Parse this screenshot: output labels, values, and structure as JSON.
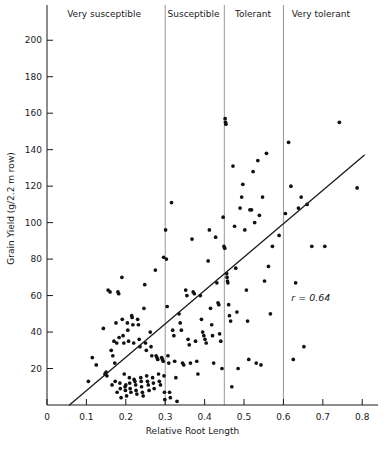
{
  "chart_data": {
    "type": "scatter",
    "title": "",
    "xlabel": "Relative Root Length",
    "ylabel": "Grain Yield (g/2.2 m row)",
    "xlim": [
      0,
      0.84
    ],
    "ylim": [
      0,
      210
    ],
    "xticks": [
      "0",
      "0.1",
      "0.2",
      "0.3",
      "0.4",
      "0.5",
      "0.6",
      "0.7",
      "0.8"
    ],
    "xtickvalues": [
      0,
      0.1,
      0.2,
      0.3,
      0.4,
      0.5,
      0.6,
      0.7,
      0.8
    ],
    "yticks": [
      "20",
      "40",
      "60",
      "80",
      "100",
      "120",
      "140",
      "160",
      "180",
      "200"
    ],
    "ytickvalues": [
      20,
      40,
      60,
      80,
      100,
      120,
      140,
      160,
      180,
      200
    ],
    "grid": false,
    "legend": "none",
    "annotation": "r = 0.64",
    "annotation_symbol": "r",
    "annotation_value": "= 0.64",
    "annotation_x": 0.62,
    "annotation_y": 57,
    "fit_line": {
      "x": [
        0.057,
        0.805
      ],
      "y": [
        0,
        137
      ]
    },
    "zones": [
      {
        "label": "Very susceptible",
        "x_start": 0.0,
        "x_end": 0.3,
        "label_x": 0.145
      },
      {
        "label": "Susceptible",
        "x_start": 0.3,
        "x_end": 0.45,
        "label_x": 0.372
      },
      {
        "label": "Tolerant",
        "x_start": 0.45,
        "x_end": 0.6,
        "label_x": 0.523
      },
      {
        "label": "Very tolerant",
        "x_start": 0.6,
        "x_end": 0.84,
        "label_x": 0.695
      }
    ],
    "zone_dividers": [
      0.3,
      0.45,
      0.6
    ],
    "points": [
      [
        0.105,
        13
      ],
      [
        0.115,
        26
      ],
      [
        0.125,
        22
      ],
      [
        0.143,
        42
      ],
      [
        0.147,
        17
      ],
      [
        0.15,
        18
      ],
      [
        0.152,
        16
      ],
      [
        0.155,
        63
      ],
      [
        0.16,
        62
      ],
      [
        0.163,
        30
      ],
      [
        0.165,
        11
      ],
      [
        0.167,
        27
      ],
      [
        0.17,
        35
      ],
      [
        0.172,
        23
      ],
      [
        0.173,
        13
      ],
      [
        0.175,
        45
      ],
      [
        0.177,
        34
      ],
      [
        0.178,
        7
      ],
      [
        0.18,
        62
      ],
      [
        0.182,
        61
      ],
      [
        0.183,
        37
      ],
      [
        0.185,
        12
      ],
      [
        0.186,
        9
      ],
      [
        0.188,
        4
      ],
      [
        0.19,
        70
      ],
      [
        0.191,
        47
      ],
      [
        0.193,
        38
      ],
      [
        0.195,
        34
      ],
      [
        0.196,
        17
      ],
      [
        0.198,
        10
      ],
      [
        0.199,
        8
      ],
      [
        0.2,
        11
      ],
      [
        0.202,
        5
      ],
      [
        0.204,
        45
      ],
      [
        0.205,
        41
      ],
      [
        0.207,
        35
      ],
      [
        0.209,
        15
      ],
      [
        0.21,
        12
      ],
      [
        0.211,
        9
      ],
      [
        0.213,
        7
      ],
      [
        0.215,
        49
      ],
      [
        0.216,
        48
      ],
      [
        0.218,
        44
      ],
      [
        0.22,
        34
      ],
      [
        0.221,
        14
      ],
      [
        0.223,
        13
      ],
      [
        0.225,
        11
      ],
      [
        0.226,
        8
      ],
      [
        0.228,
        6
      ],
      [
        0.23,
        47
      ],
      [
        0.232,
        44
      ],
      [
        0.234,
        36
      ],
      [
        0.236,
        32
      ],
      [
        0.238,
        15
      ],
      [
        0.239,
        13
      ],
      [
        0.24,
        10
      ],
      [
        0.242,
        7
      ],
      [
        0.244,
        5
      ],
      [
        0.246,
        53
      ],
      [
        0.248,
        66
      ],
      [
        0.25,
        34
      ],
      [
        0.252,
        30
      ],
      [
        0.253,
        16
      ],
      [
        0.255,
        13
      ],
      [
        0.257,
        11
      ],
      [
        0.259,
        8
      ],
      [
        0.262,
        40
      ],
      [
        0.264,
        32
      ],
      [
        0.266,
        27
      ],
      [
        0.268,
        15
      ],
      [
        0.27,
        12
      ],
      [
        0.272,
        9
      ],
      [
        0.275,
        74
      ],
      [
        0.277,
        27
      ],
      [
        0.279,
        26
      ],
      [
        0.281,
        25
      ],
      [
        0.283,
        17
      ],
      [
        0.285,
        13
      ],
      [
        0.288,
        11
      ],
      [
        0.291,
        26
      ],
      [
        0.293,
        25
      ],
      [
        0.295,
        24
      ],
      [
        0.296,
        81
      ],
      [
        0.297,
        16
      ],
      [
        0.298,
        7
      ],
      [
        0.299,
        3
      ],
      [
        0.301,
        96
      ],
      [
        0.303,
        80
      ],
      [
        0.305,
        54
      ],
      [
        0.307,
        27
      ],
      [
        0.309,
        23
      ],
      [
        0.311,
        7
      ],
      [
        0.313,
        4
      ],
      [
        0.316,
        111
      ],
      [
        0.319,
        41
      ],
      [
        0.322,
        38
      ],
      [
        0.324,
        24
      ],
      [
        0.327,
        15
      ],
      [
        0.33,
        2
      ],
      [
        0.335,
        50
      ],
      [
        0.338,
        45
      ],
      [
        0.341,
        41
      ],
      [
        0.344,
        23
      ],
      [
        0.347,
        22
      ],
      [
        0.352,
        63
      ],
      [
        0.355,
        60
      ],
      [
        0.358,
        36
      ],
      [
        0.361,
        33
      ],
      [
        0.364,
        23
      ],
      [
        0.368,
        91
      ],
      [
        0.371,
        62
      ],
      [
        0.374,
        61
      ],
      [
        0.377,
        35
      ],
      [
        0.38,
        24
      ],
      [
        0.383,
        17
      ],
      [
        0.389,
        60
      ],
      [
        0.392,
        47
      ],
      [
        0.395,
        40
      ],
      [
        0.398,
        38
      ],
      [
        0.401,
        36
      ],
      [
        0.404,
        34
      ],
      [
        0.409,
        79
      ],
      [
        0.412,
        96
      ],
      [
        0.415,
        53
      ],
      [
        0.418,
        44
      ],
      [
        0.42,
        38
      ],
      [
        0.423,
        23
      ],
      [
        0.428,
        92
      ],
      [
        0.431,
        67
      ],
      [
        0.434,
        56
      ],
      [
        0.436,
        55
      ],
      [
        0.438,
        39
      ],
      [
        0.441,
        35
      ],
      [
        0.444,
        20
      ],
      [
        0.447,
        103
      ],
      [
        0.449,
        87
      ],
      [
        0.451,
        86
      ],
      [
        0.452,
        157
      ],
      [
        0.453,
        155
      ],
      [
        0.454,
        154
      ],
      [
        0.456,
        72
      ],
      [
        0.457,
        70
      ],
      [
        0.458,
        68
      ],
      [
        0.459,
        67
      ],
      [
        0.461,
        55
      ],
      [
        0.463,
        49
      ],
      [
        0.466,
        46
      ],
      [
        0.469,
        10
      ],
      [
        0.472,
        131
      ],
      [
        0.476,
        98
      ],
      [
        0.479,
        75
      ],
      [
        0.482,
        51
      ],
      [
        0.485,
        20
      ],
      [
        0.49,
        108
      ],
      [
        0.494,
        114
      ],
      [
        0.497,
        121
      ],
      [
        0.502,
        96
      ],
      [
        0.506,
        63
      ],
      [
        0.509,
        46
      ],
      [
        0.512,
        25
      ],
      [
        0.515,
        107
      ],
      [
        0.519,
        107
      ],
      [
        0.523,
        128
      ],
      [
        0.527,
        100
      ],
      [
        0.531,
        23
      ],
      [
        0.535,
        134
      ],
      [
        0.539,
        104
      ],
      [
        0.543,
        22
      ],
      [
        0.547,
        114
      ],
      [
        0.552,
        68
      ],
      [
        0.557,
        138
      ],
      [
        0.562,
        76
      ],
      [
        0.567,
        50
      ],
      [
        0.572,
        87
      ],
      [
        0.589,
        93
      ],
      [
        0.605,
        105
      ],
      [
        0.613,
        144
      ],
      [
        0.619,
        120
      ],
      [
        0.625,
        25
      ],
      [
        0.631,
        67
      ],
      [
        0.638,
        108
      ],
      [
        0.645,
        114
      ],
      [
        0.652,
        32
      ],
      [
        0.66,
        110
      ],
      [
        0.672,
        87
      ],
      [
        0.705,
        87
      ],
      [
        0.742,
        155
      ],
      [
        0.787,
        119
      ]
    ]
  }
}
